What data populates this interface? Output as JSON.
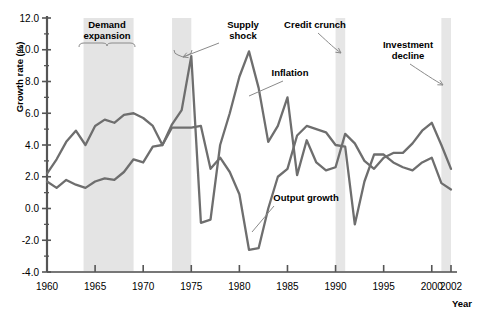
{
  "chart_data": {
    "type": "line",
    "title": "",
    "xlabel": "Year",
    "ylabel": "Growth rate (%)",
    "xlim": [
      1960,
      2002
    ],
    "ylim": [
      -4.0,
      12.0
    ],
    "grid": false,
    "legend_position": "none (inline annotations)",
    "x": [
      1960,
      1961,
      1962,
      1963,
      1964,
      1965,
      1966,
      1967,
      1968,
      1969,
      1970,
      1971,
      1972,
      1973,
      1974,
      1975,
      1976,
      1977,
      1978,
      1979,
      1980,
      1981,
      1982,
      1983,
      1984,
      1985,
      1986,
      1987,
      1988,
      1989,
      1990,
      1991,
      1992,
      1993,
      1994,
      1995,
      1996,
      1997,
      1998,
      1999,
      2000,
      2001,
      2002
    ],
    "ytick_labels": [
      "-4.0",
      "-2.0",
      "0.0",
      "2.0",
      "4.0",
      "6.0",
      "8.0",
      "10.0",
      "12.0"
    ],
    "ytick_values": [
      -4.0,
      -2.0,
      0.0,
      2.0,
      4.0,
      6.0,
      8.0,
      10.0,
      12.0
    ],
    "xtick_labels": [
      "1960",
      "1965",
      "1970",
      "1975",
      "1980",
      "1985",
      "1990",
      "1995",
      "2000",
      "2002"
    ],
    "xtick_values": [
      1960,
      1965,
      1970,
      1975,
      1980,
      1985,
      1990,
      1995,
      2000,
      2002
    ],
    "series": [
      {
        "name": "Inflation",
        "color": "#6e6e6e",
        "values": [
          2.2,
          3.1,
          4.2,
          4.9,
          4.0,
          5.2,
          5.6,
          5.4,
          5.9,
          6.0,
          5.7,
          5.2,
          4.0,
          5.3,
          6.2,
          9.6,
          -0.9,
          -0.7,
          4.0,
          6.0,
          8.3,
          9.9,
          7.6,
          4.2,
          5.2,
          7.0,
          2.1,
          4.3,
          2.9,
          2.4,
          2.6,
          4.7,
          4.1,
          3.0,
          2.5,
          3.2,
          3.5,
          3.5,
          4.1,
          4.9,
          5.4,
          4.0,
          2.5
        ]
      },
      {
        "name": "Output growth",
        "color": "#6e6e6e",
        "values": [
          1.7,
          1.3,
          1.8,
          1.5,
          1.3,
          1.7,
          1.9,
          1.8,
          2.3,
          3.1,
          2.9,
          3.9,
          4.0,
          5.1,
          5.1,
          5.1,
          5.2,
          2.5,
          3.2,
          2.3,
          0.9,
          -2.6,
          -2.5,
          0.0,
          2.0,
          2.5,
          4.6,
          5.2,
          5.0,
          4.8,
          4.0,
          3.9,
          -1.0,
          1.7,
          3.4,
          3.4,
          2.9,
          2.6,
          2.4,
          2.9,
          3.2,
          1.6,
          1.2
        ]
      }
    ],
    "shaded_bands": [
      {
        "name": "Demand expansion",
        "start": 1963.8,
        "end": 1969.0,
        "color": "#e4e4e4"
      },
      {
        "name": "Supply shock",
        "start": 1973.0,
        "end": 1975.0,
        "color": "#e4e4e4"
      },
      {
        "name": "Credit crunch",
        "start": 1990.0,
        "end": 1991.0,
        "color": "#e6e6e6"
      },
      {
        "name": "Investment decline",
        "start": 2001.0,
        "end": 2002.0,
        "color": "#e6e6e6"
      }
    ],
    "annotations": [
      {
        "label": "Demand expansion",
        "line1": "Demand",
        "line2": "expansion"
      },
      {
        "label": "Supply shock",
        "line1": "Supply",
        "line2": "shock"
      },
      {
        "label": "Credit crunch",
        "line1": "Credit crunch",
        "line2": ""
      },
      {
        "label": "Investment decline",
        "line1": "Investment",
        "line2": "decline"
      },
      {
        "label": "Inflation",
        "line1": "Inflation",
        "line2": ""
      },
      {
        "label": "Output growth",
        "line1": "Output growth",
        "line2": ""
      }
    ]
  },
  "axes": {
    "y_title": "Growth rate (%)",
    "x_title": "Year"
  }
}
